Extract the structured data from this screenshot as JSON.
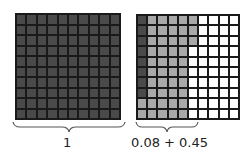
{
  "colors": {
    "dark": "#4a4a4a",
    "light": "#a9a9a9",
    "empty": "#ffffff",
    "line": "#1a1a1a"
  },
  "left_grid": {
    "label": "1",
    "rows": 10,
    "cols": 10,
    "shaded_dark": 100
  },
  "right_grid": {
    "label": "0.08 + 0.45",
    "rows": 10,
    "cols": 10,
    "dark_cells": "column 1, rows 1-8 (8 cells)",
    "light_cells": "column 1 rows 9-10, columns 2-5, column 6 rows 1-3 (45 cells)",
    "map": [
      "DLLLLL....",
      "DLLLLL....",
      "DLLLLL....",
      "DLLLL.....",
      "DLLLL.....",
      "DLLLL.....",
      "DLLLL.....",
      "DLLLL.....",
      "LLLLL.....",
      "LLLLL....."
    ]
  }
}
